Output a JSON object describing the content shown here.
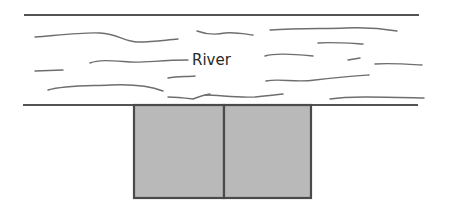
{
  "diagram": {
    "label": "River",
    "river": {
      "top_bank": {
        "x1": 24,
        "y": 15,
        "x2": 419
      },
      "bottom_bank": {
        "x1": 23,
        "y": 105,
        "x2": 418
      }
    },
    "plots": [
      {
        "name": "left-plot",
        "x": 134,
        "y": 105,
        "width": 90,
        "height": 93
      },
      {
        "name": "right-plot",
        "x": 224,
        "y": 105,
        "width": 87,
        "height": 93
      }
    ],
    "colors": {
      "bank_line": "#1a1a1a",
      "water_wave": "#6e6e6e",
      "plot_fill": "#b9b9b9",
      "plot_border": "#4a4a4a"
    }
  }
}
